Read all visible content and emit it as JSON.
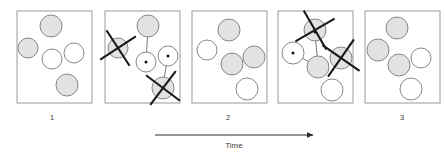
{
  "figure": {
    "title": "",
    "time_axis": {
      "label": "Time",
      "arrow_icon": "arrow-right-icon",
      "x_start": 155,
      "x_end": 313,
      "y": 135
    },
    "legend": {
      "shaded_circle_meaning": "shaded-particle",
      "open_circle_meaning": "open-particle",
      "x_mark_meaning": "removed-particle"
    },
    "panels": [
      {
        "id": "panel-state-1",
        "kind": "state",
        "label": "1",
        "label_x": 52,
        "label_y": 120,
        "box": {
          "x": 17,
          "y": 11,
          "width": 75,
          "height": 92
        },
        "circles": [
          {
            "cx": 51,
            "cy": 26,
            "r": 11,
            "fill": "shaded"
          },
          {
            "cx": 28,
            "cy": 48,
            "r": 10,
            "fill": "shaded"
          },
          {
            "cx": 52,
            "cy": 59,
            "r": 10,
            "fill": "open"
          },
          {
            "cx": 74,
            "cy": 53,
            "r": 10,
            "fill": "open"
          },
          {
            "cx": 67,
            "cy": 85,
            "r": 11,
            "fill": "shaded"
          }
        ],
        "xmarks": [],
        "connectors": []
      },
      {
        "id": "panel-transition-1",
        "kind": "transition",
        "label": "",
        "label_x": 0,
        "label_y": 0,
        "box": {
          "x": 105,
          "y": 11,
          "width": 75,
          "height": 92
        },
        "circles": [
          {
            "cx": 148,
            "cy": 26,
            "r": 11,
            "fill": "shaded"
          },
          {
            "cx": 118,
            "cy": 48,
            "r": 10,
            "fill": "shaded"
          },
          {
            "cx": 146,
            "cy": 62,
            "r": 10,
            "fill": "open"
          },
          {
            "cx": 168,
            "cy": 56,
            "r": 10,
            "fill": "open"
          },
          {
            "cx": 163,
            "cy": 88,
            "r": 11,
            "fill": "shaded"
          }
        ],
        "xmarks": [
          {
            "cx": 118,
            "cy": 48,
            "size": 15,
            "rot": 12
          },
          {
            "cx": 163,
            "cy": 88,
            "size": 15,
            "rot": -8
          }
        ],
        "connectors": [
          {
            "x1": 148,
            "y1": 28,
            "x2": 146,
            "y2": 62,
            "dot_x": 146,
            "dot_y": 62
          },
          {
            "x1": 163,
            "y1": 85,
            "x2": 168,
            "y2": 56,
            "dot_x": 168,
            "dot_y": 56
          }
        ]
      },
      {
        "id": "panel-state-2",
        "kind": "state",
        "label": "2",
        "label_x": 228,
        "label_y": 120,
        "box": {
          "x": 192,
          "y": 11,
          "width": 75,
          "height": 92
        },
        "circles": [
          {
            "cx": 229,
            "cy": 30,
            "r": 11,
            "fill": "shaded"
          },
          {
            "cx": 207,
            "cy": 50,
            "r": 10,
            "fill": "open"
          },
          {
            "cx": 232,
            "cy": 64,
            "r": 11,
            "fill": "shaded"
          },
          {
            "cx": 254,
            "cy": 57,
            "r": 11,
            "fill": "shaded"
          },
          {
            "cx": 247,
            "cy": 89,
            "r": 11,
            "fill": "open"
          }
        ],
        "xmarks": [],
        "connectors": []
      },
      {
        "id": "panel-transition-2",
        "kind": "transition",
        "label": "",
        "label_x": 0,
        "label_y": 0,
        "box": {
          "x": 278,
          "y": 11,
          "width": 75,
          "height": 92
        },
        "circles": [
          {
            "cx": 315,
            "cy": 30,
            "r": 11,
            "fill": "shaded"
          },
          {
            "cx": 293,
            "cy": 53,
            "r": 11,
            "fill": "open"
          },
          {
            "cx": 318,
            "cy": 67,
            "r": 11,
            "fill": "shaded"
          },
          {
            "cx": 341,
            "cy": 58,
            "r": 11,
            "fill": "shaded"
          },
          {
            "cx": 332,
            "cy": 90,
            "r": 11,
            "fill": "open"
          }
        ],
        "xmarks": [
          {
            "cx": 315,
            "cy": 30,
            "size": 16,
            "rot": 15
          },
          {
            "cx": 341,
            "cy": 58,
            "size": 16,
            "rot": -10
          }
        ],
        "connectors": [
          {
            "x1": 315,
            "y1": 32,
            "x2": 318,
            "y2": 67,
            "dot_x": 315,
            "dot_y": 32
          },
          {
            "x1": 293,
            "y1": 53,
            "x2": 318,
            "y2": 67,
            "dot_x": 293,
            "dot_y": 53
          }
        ]
      },
      {
        "id": "panel-state-3",
        "kind": "state",
        "label": "3",
        "label_x": 402,
        "label_y": 120,
        "box": {
          "x": 365,
          "y": 11,
          "width": 75,
          "height": 92
        },
        "circles": [
          {
            "cx": 397,
            "cy": 28,
            "r": 11,
            "fill": "shaded"
          },
          {
            "cx": 378,
            "cy": 50,
            "r": 11,
            "fill": "shaded"
          },
          {
            "cx": 399,
            "cy": 65,
            "r": 11,
            "fill": "shaded"
          },
          {
            "cx": 421,
            "cy": 58,
            "r": 10,
            "fill": "open"
          },
          {
            "cx": 411,
            "cy": 89,
            "r": 11,
            "fill": "open"
          }
        ],
        "xmarks": [],
        "connectors": []
      }
    ],
    "colors": {
      "shaded_fill": "#e2e2e2",
      "open_fill": "#ffffff",
      "circle_stroke": "#7a7a7a",
      "box_stroke": "#8f8f8f",
      "xmark_stroke": "#1a1a1a",
      "connector_stroke": "#555555",
      "text": "#3a3a3a",
      "background": "#ffffff"
    }
  }
}
